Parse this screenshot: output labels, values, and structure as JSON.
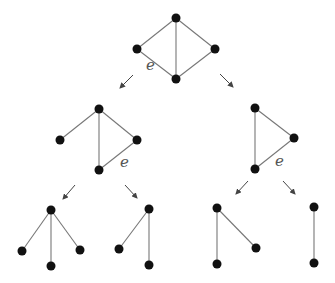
{
  "diagram": {
    "type": "graph-deletion-contraction-tree",
    "edge_label": "e",
    "colors": {
      "vertex": "#111111",
      "edge": "#777777",
      "arrow": "#444444",
      "label": "#555555"
    },
    "graphs": [
      {
        "id": "root",
        "vertices": [
          [
            176,
            18
          ],
          [
            137,
            49
          ],
          [
            215,
            49
          ],
          [
            176,
            79
          ]
        ],
        "edges": [
          [
            0,
            1
          ],
          [
            0,
            2
          ],
          [
            0,
            3
          ],
          [
            1,
            3
          ],
          [
            2,
            3
          ]
        ],
        "label": {
          "text": "e",
          "x": 146,
          "y": 70
        }
      },
      {
        "id": "mid-left",
        "vertices": [
          [
            99,
            109
          ],
          [
            60,
            140
          ],
          [
            137,
            140
          ],
          [
            99,
            170
          ]
        ],
        "edges": [
          [
            0,
            1
          ],
          [
            0,
            2
          ],
          [
            0,
            3
          ],
          [
            3,
            2
          ]
        ],
        "label": {
          "text": "e",
          "x": 120,
          "y": 167
        }
      },
      {
        "id": "mid-right",
        "vertices": [
          [
            255,
            108
          ],
          [
            294,
            138
          ],
          [
            255,
            169
          ]
        ],
        "edges": [
          [
            0,
            1
          ],
          [
            0,
            2
          ],
          [
            2,
            1
          ]
        ],
        "label": {
          "text": "e",
          "x": 275,
          "y": 166
        }
      },
      {
        "id": "bottom-1",
        "vertices": [
          [
            51,
            210
          ],
          [
            22,
            251
          ],
          [
            51,
            266
          ],
          [
            80,
            250
          ]
        ],
        "edges": [
          [
            0,
            1
          ],
          [
            0,
            2
          ],
          [
            0,
            3
          ]
        ]
      },
      {
        "id": "bottom-2",
        "vertices": [
          [
            149,
            209
          ],
          [
            119,
            249
          ],
          [
            149,
            265
          ]
        ],
        "edges": [
          [
            0,
            1
          ],
          [
            0,
            2
          ]
        ]
      },
      {
        "id": "bottom-3",
        "vertices": [
          [
            217,
            208
          ],
          [
            256,
            248
          ],
          [
            217,
            264
          ]
        ],
        "edges": [
          [
            0,
            1
          ],
          [
            0,
            2
          ]
        ]
      },
      {
        "id": "bottom-4",
        "vertices": [
          [
            314,
            207
          ],
          [
            314,
            263
          ]
        ],
        "edges": [
          [
            0,
            1
          ]
        ]
      }
    ],
    "arrows": [
      {
        "from": [
          133,
          75
        ],
        "to": [
          120,
          88
        ]
      },
      {
        "from": [
          220,
          74
        ],
        "to": [
          233,
          87
        ]
      },
      {
        "from": [
          75,
          185
        ],
        "to": [
          63,
          199
        ]
      },
      {
        "from": [
          125,
          185
        ],
        "to": [
          137,
          198
        ]
      },
      {
        "from": [
          248,
          181
        ],
        "to": [
          236,
          194
        ]
      },
      {
        "from": [
          283,
          181
        ],
        "to": [
          295,
          194
        ]
      }
    ]
  }
}
